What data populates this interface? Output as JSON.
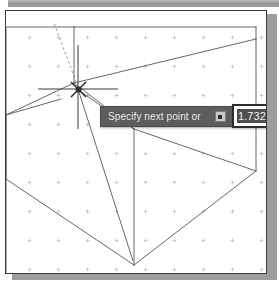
{
  "app": {
    "kind": "cad-drawing-window",
    "canvas_background": "#ffffff",
    "geometry_line_color": "#565656",
    "grid_dot_color": "#b4b4b4",
    "frame_border_color": "#3a3a3a",
    "shadow_color": "#9d9d9d",
    "title_strip_color": "#9a9a9a"
  },
  "dynamic_input": {
    "prompt_label": "Specify next point or",
    "options_button_icon": "options-square-icon",
    "options_button_tooltip": "Specify next point or",
    "tooltip_background": "#5d5d5d",
    "tooltip_text_color": "#ffffff",
    "value_field": {
      "value": "1.7321",
      "placeholder": "1.7321",
      "selected": true,
      "border_color": "#2d2d2d",
      "selection_background": "#4f4f4f"
    }
  },
  "cursor": {
    "name": "crosshair-with-osnap-marker",
    "x": 80,
    "y": 79,
    "snap_marker": "intersection-x-marker",
    "polar_tracking": "dashed-alignment-line"
  },
  "drawing": {
    "description": "Isometric box wireframe with rubber-band line from cursor",
    "grid": {
      "visible": true,
      "marker": "plus-cross",
      "spacing_px": 29
    },
    "entities": [
      {
        "name": "box-top-face",
        "type": "polyline"
      },
      {
        "name": "box-left-face",
        "type": "polyline"
      },
      {
        "name": "box-right-face",
        "type": "polyline"
      },
      {
        "name": "vertical-edge-center",
        "type": "line"
      },
      {
        "name": "rubber-band-line",
        "type": "line"
      },
      {
        "name": "polar-tracking-line",
        "type": "dashed-line"
      }
    ]
  }
}
